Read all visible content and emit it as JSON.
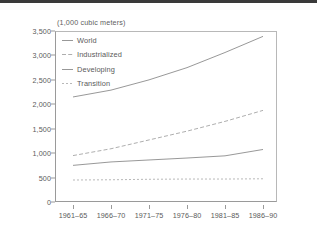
{
  "chart_data": {
    "type": "line",
    "title": "(1,000 cubic meters)",
    "xlabel": "",
    "ylabel": "",
    "ylim": [
      0,
      3500
    ],
    "yticks": [
      0,
      500,
      1000,
      1500,
      2000,
      2500,
      3000,
      3500
    ],
    "ytick_labels": [
      "0",
      "500",
      "1,000",
      "1,500",
      "2,000",
      "2,500",
      "3,000",
      "3,500"
    ],
    "grid": false,
    "legend_position": "top-left",
    "categories": [
      "1961–65",
      "1966–70",
      "1971–75",
      "1976–80",
      "1981–85",
      "1986–90"
    ],
    "series": [
      {
        "name": "World",
        "style": "solid",
        "color": "#8c8c8c",
        "values": [
          2150,
          2290,
          2500,
          2750,
          3060,
          3390
        ]
      },
      {
        "name": "Industrialized",
        "style": "dashed",
        "color": "#a5a5a5",
        "values": [
          950,
          1090,
          1270,
          1450,
          1650,
          1875
        ]
      },
      {
        "name": "Developing",
        "style": "solid",
        "color": "#8c8c8c",
        "values": [
          750,
          820,
          860,
          900,
          945,
          1075
        ]
      },
      {
        "name": "Transition",
        "style": "dotted",
        "color": "#b0b0b0",
        "values": [
          450,
          455,
          465,
          470,
          470,
          475
        ]
      }
    ]
  },
  "colors": {
    "axis": "#9a9a9a",
    "text": "#5a5a5a",
    "background": "#ffffff",
    "top_rule": "#3a3a3a"
  }
}
